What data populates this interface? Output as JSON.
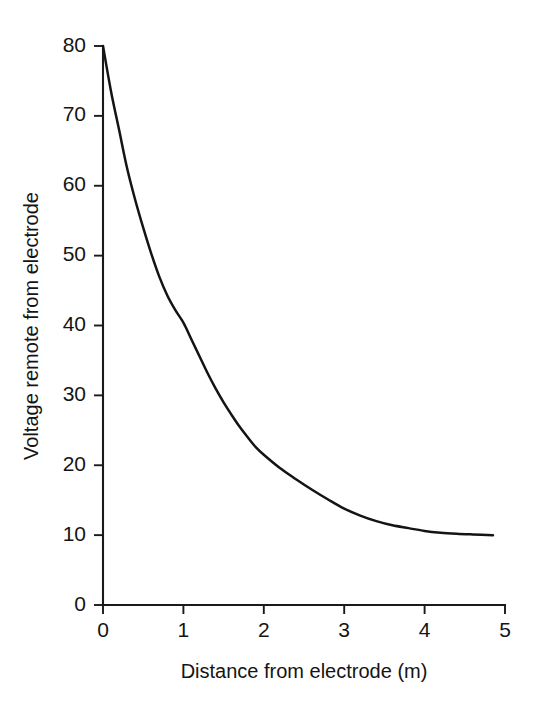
{
  "chart_data": {
    "type": "line",
    "title": "",
    "subtitle": "",
    "xlabel": "Distance from electrode (m)",
    "ylabel": "Voltage remote from electrode",
    "xlim": [
      0,
      5
    ],
    "ylim": [
      0,
      80
    ],
    "xticks": [
      0,
      1,
      2,
      3,
      4,
      5
    ],
    "yticks": [
      0,
      10,
      20,
      30,
      40,
      50,
      60,
      70,
      80
    ],
    "xtick_labels": [
      "0",
      "1",
      "2",
      "3",
      "4",
      "5"
    ],
    "ytick_labels": [
      "0",
      "10",
      "20",
      "30",
      "40",
      "50",
      "60",
      "70",
      "80"
    ],
    "grid": false,
    "legend": false,
    "legend_position": "none",
    "line_color": "#141414",
    "background_color": "#ffffff",
    "series": [
      {
        "name": "Voltage decay",
        "x": [
          0.0,
          0.1,
          0.2,
          0.3,
          0.4,
          0.5,
          0.6,
          0.7,
          0.8,
          0.9,
          1.0,
          1.1,
          1.2,
          1.3,
          1.4,
          1.5,
          1.6,
          1.7,
          1.8,
          1.9,
          2.0,
          2.2,
          2.4,
          2.6,
          2.8,
          3.0,
          3.2,
          3.4,
          3.6,
          3.8,
          4.0,
          4.2,
          4.4,
          4.6,
          4.85
        ],
        "y": [
          80.0,
          73.5,
          68.0,
          62.5,
          58.0,
          54.0,
          50.3,
          47.0,
          44.3,
          42.2,
          40.4,
          38.0,
          35.6,
          33.2,
          31.0,
          29.0,
          27.2,
          25.5,
          24.0,
          22.6,
          21.5,
          19.6,
          18.0,
          16.5,
          15.1,
          13.8,
          12.8,
          12.0,
          11.4,
          11.0,
          10.6,
          10.35,
          10.2,
          10.1,
          10.0
        ]
      }
    ],
    "asymptote": 10,
    "start_value": 80,
    "end_value": 10
  },
  "axes": {
    "y_axis_name": "y-axis",
    "x_axis_name": "x-axis"
  }
}
